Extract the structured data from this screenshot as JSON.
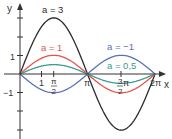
{
  "chart_data": {
    "type": "line",
    "title": "",
    "xlabel": "x",
    "ylabel": "y",
    "function": "f(x) = a·sin(x)",
    "xlim": [
      0,
      6.2832
    ],
    "ylim": [
      -3,
      3
    ],
    "x_ticks": [
      {
        "value": 1,
        "label": "1"
      },
      {
        "value": 1.5708,
        "label": "π/2"
      },
      {
        "value": 3.1416,
        "label": "π"
      },
      {
        "value": 4.7124,
        "label": "3/2 π"
      },
      {
        "value": 6.2832,
        "label": "2π"
      }
    ],
    "y_ticks": [
      {
        "value": 1,
        "label": "1"
      },
      {
        "value": -1,
        "label": "-1"
      }
    ],
    "series": [
      {
        "name": "a = 3",
        "a": 3,
        "color": "#2b2b2b",
        "label_pos": [
          53,
          11
        ]
      },
      {
        "name": "a = 1",
        "a": 1,
        "color": "#e8534a",
        "label_pos": [
          40,
          49
        ]
      },
      {
        "name": "a = -1",
        "a": -1,
        "color": "#5a72b5",
        "label_pos": [
          110,
          39
        ]
      },
      {
        "name": "a = 0,5",
        "a": 0.5,
        "color": "#3a9c8c",
        "label_pos": [
          118,
          68
        ]
      }
    ],
    "grid": false,
    "legend": "inline labels"
  },
  "labels": {
    "x_axis": "x",
    "y_axis": "y",
    "tick_1": "1",
    "tick_half_pi_num": "π",
    "tick_half_pi_den": "2",
    "tick_pi": "π",
    "tick_3half_num": "3",
    "tick_3half_den": "2",
    "tick_3half_pi": "π",
    "tick_2pi": "2π",
    "y_tick_1": "1",
    "y_tick_m1": "−1",
    "series_a3": "a = 3",
    "series_a1": "a = 1",
    "series_am1": "a = −1",
    "series_a05": "a = 0,5"
  }
}
